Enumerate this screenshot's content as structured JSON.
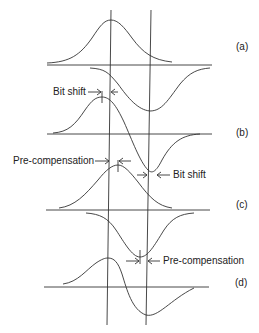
{
  "diagram": {
    "panels": [
      {
        "id": "a",
        "label": "(a)"
      },
      {
        "id": "b",
        "label": "(b)"
      },
      {
        "id": "c",
        "label": "(c)"
      },
      {
        "id": "d",
        "label": "(d)"
      }
    ],
    "annotations": {
      "bit_shift_top": "Bit shift",
      "pre_comp_left": "Pre-compensation",
      "bit_shift_right": "Bit shift",
      "pre_comp_right": "Pre-compensation"
    },
    "colors": {
      "line": "#333333",
      "background": "#ffffff"
    }
  }
}
